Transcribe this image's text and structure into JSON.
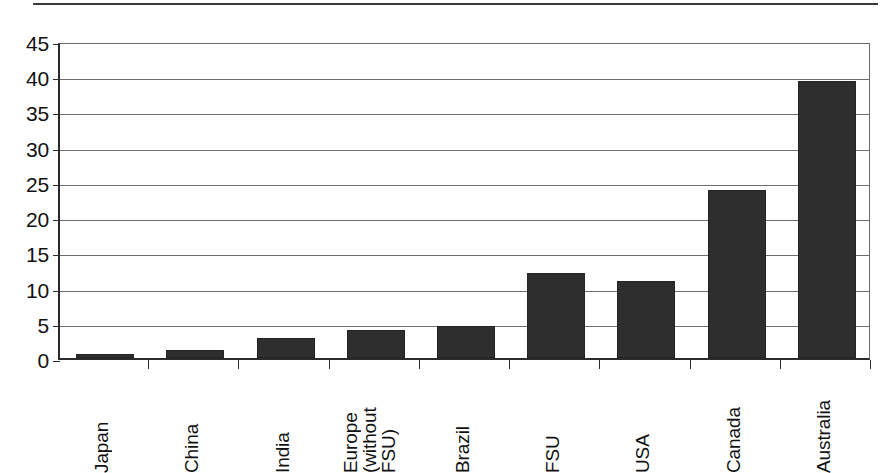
{
  "page": {
    "width": 894,
    "height": 473,
    "background": "#ffffff",
    "rule_color": "#3a3a3a"
  },
  "chart_data": {
    "type": "bar",
    "title": "",
    "subtitle": "",
    "xlabel": "",
    "ylabel": "",
    "categories": [
      "Japan",
      "China",
      "India",
      "Europe (without FSU)",
      "Brazil",
      "FSU",
      "USA",
      "Canada",
      "Australia"
    ],
    "category_lines": [
      [
        "Japan"
      ],
      [
        "China"
      ],
      [
        "India"
      ],
      [
        "Europe",
        "(without",
        "FSU)"
      ],
      [
        "Brazil"
      ],
      [
        "FSU"
      ],
      [
        "USA"
      ],
      [
        "Canada"
      ],
      [
        "Australia"
      ]
    ],
    "values": [
      0.5,
      1.1,
      2.8,
      4.0,
      4.6,
      12.1,
      11.0,
      23.8,
      39.3
    ],
    "ylim": [
      0,
      45
    ],
    "ytick_labels": [
      "0",
      "5",
      "10",
      "15",
      "20",
      "25",
      "30",
      "35",
      "40",
      "45"
    ],
    "ytick_values": [
      0,
      5,
      10,
      15,
      20,
      25,
      30,
      35,
      40,
      45
    ],
    "grid": true,
    "grid_axis": "y",
    "legend": false,
    "legend_position": "none",
    "bar_color": "#2e2e2e",
    "axis_color": "#2b2b2b",
    "grid_color": "#6e6e6e",
    "orientation": "vertical",
    "xtick_label_rotation": 90
  },
  "layout": {
    "plot_left": 58,
    "plot_top": 43,
    "plot_right": 870,
    "plot_bottom": 360,
    "bar_width": 58,
    "slot_count": 9
  }
}
